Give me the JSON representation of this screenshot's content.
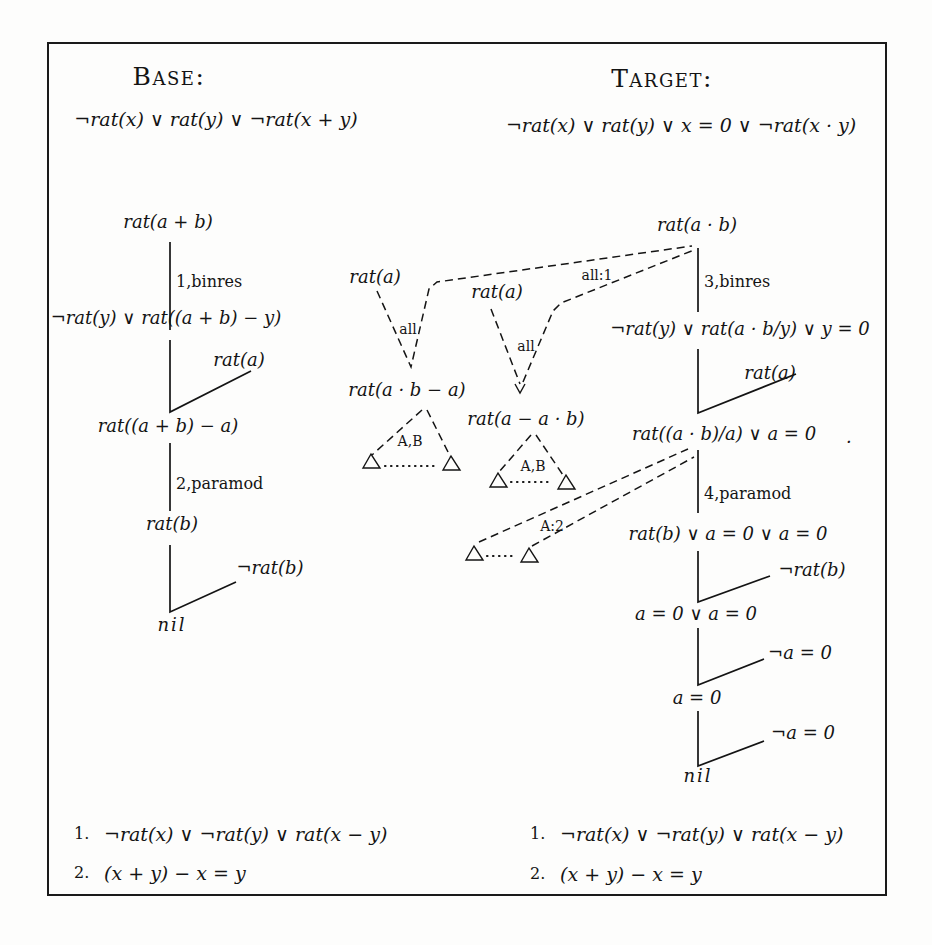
{
  "page": {
    "background_color": "#fdfdfc",
    "ink_color": "#141414",
    "border_color": "#1a1a1a"
  },
  "headers": {
    "base_title": "Base:",
    "base_clause": "¬rat(x) ∨ rat(y) ∨ ¬rat(x + y)",
    "target_title": "Target:",
    "target_clause": "¬rat(x) ∨ rat(y) ∨ x = 0 ∨ ¬rat(x · y)"
  },
  "base_tree": {
    "root": "rat(a + b)",
    "step1": "1,binres",
    "node2": "¬rat(y) ∨ rat((a + b) − y)",
    "side1": "rat(a)",
    "node3": "rat((a + b) − a)",
    "step2": "2,paramod",
    "node4": "rat(b)",
    "side2": "¬rat(b)",
    "leaf": "nil"
  },
  "target_tree": {
    "root": "rat(a · b)",
    "step1": "3,binres",
    "node2": "¬rat(y) ∨ rat(a · b/y) ∨ y = 0",
    "side1": "rat(a)",
    "node3": "rat((a · b)/a) ∨ a = 0",
    "period": ".",
    "step2": "4,paramod",
    "node4": "rat(b) ∨ a = 0 ∨ a = 0",
    "side2": "¬rat(b)",
    "node5": "a = 0 ∨ a = 0",
    "side3": "¬a = 0",
    "node6": "a = 0",
    "side4": "¬a = 0",
    "leaf": "nil"
  },
  "analogy": {
    "rat_a_left": "rat(a)",
    "all_left": "all",
    "rat_a_right": "rat(a)",
    "all_right": "all",
    "all_ref": "all:1",
    "lemma_left": "rat(a · b − a)",
    "ab_left": "A,B",
    "lemma_right": "rat(a − a · b)",
    "ab_right": "A,B",
    "a2_ref": "A:2"
  },
  "axioms_base": {
    "num1": "1.",
    "formula1": "¬rat(x) ∨ ¬rat(y) ∨ rat(x − y)",
    "num2": "2.",
    "formula2": "(x + y) − x = y"
  },
  "axioms_target": {
    "num1": "1.",
    "formula1": "¬rat(x) ∨ ¬rat(y) ∨ rat(x − y)",
    "num2": "2.",
    "formula2": "(x + y) − x = y"
  }
}
